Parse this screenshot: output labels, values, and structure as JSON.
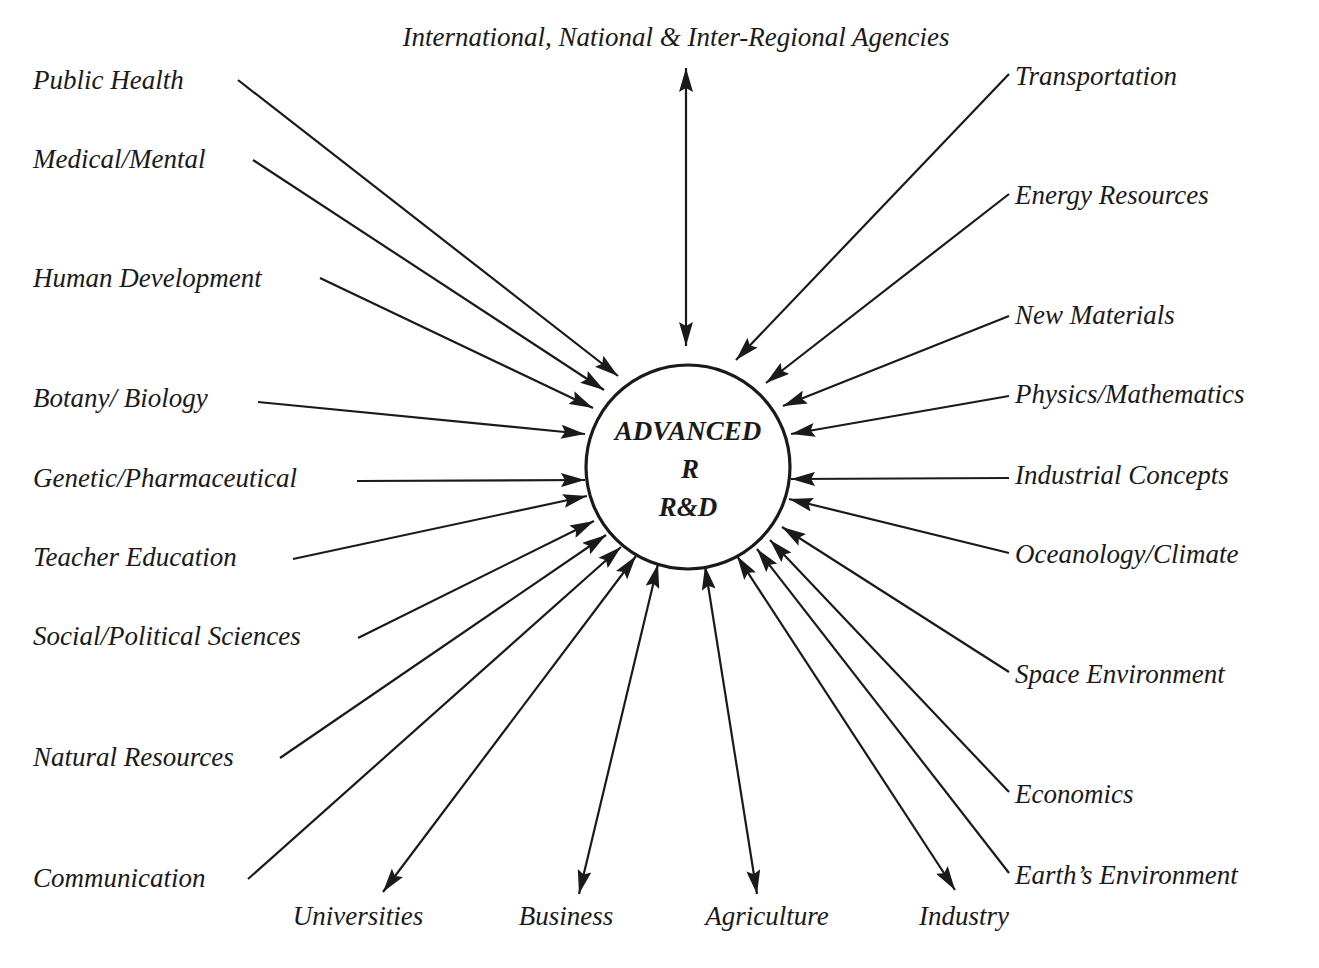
{
  "hub": {
    "line1": "ADVANCED",
    "line2": "R",
    "line3": "R&D",
    "cx": 688,
    "cy": 467,
    "r": 102
  },
  "top": {
    "label": "International, National & Inter-Regional Agencies",
    "direction": "bidirectional"
  },
  "left_nodes": [
    {
      "label": "Public Health",
      "direction": "inbound"
    },
    {
      "label": "Medical/Mental",
      "direction": "inbound"
    },
    {
      "label": "Human Development",
      "direction": "inbound"
    },
    {
      "label": "Botany/ Biology",
      "direction": "inbound"
    },
    {
      "label": "Genetic/Pharmaceutical",
      "direction": "inbound"
    },
    {
      "label": "Teacher Education",
      "direction": "inbound"
    },
    {
      "label": "Social/Political Sciences",
      "direction": "inbound"
    },
    {
      "label": "Natural Resources",
      "direction": "inbound"
    },
    {
      "label": "Communication",
      "direction": "inbound"
    }
  ],
  "bottom_nodes": [
    {
      "label": "Universities",
      "direction": "bidirectional"
    },
    {
      "label": "Business",
      "direction": "bidirectional"
    },
    {
      "label": "Agriculture",
      "direction": "bidirectional"
    },
    {
      "label": "Industry",
      "direction": "bidirectional"
    }
  ],
  "right_nodes": [
    {
      "label": "Transportation",
      "direction": "inbound"
    },
    {
      "label": "Energy Resources",
      "direction": "inbound"
    },
    {
      "label": "New Materials",
      "direction": "inbound"
    },
    {
      "label": "Physics/Mathematics",
      "direction": "inbound"
    },
    {
      "label": "Industrial Concepts",
      "direction": "inbound"
    },
    {
      "label": "Oceanology/Climate",
      "direction": "inbound"
    },
    {
      "label": "Space Environment",
      "direction": "inbound"
    },
    {
      "label": "Economics",
      "direction": "inbound"
    },
    {
      "label": "Earth’s Environment",
      "direction": "inbound"
    }
  ],
  "colors": {
    "ink": "#1a1a1a",
    "background": "#ffffff"
  }
}
